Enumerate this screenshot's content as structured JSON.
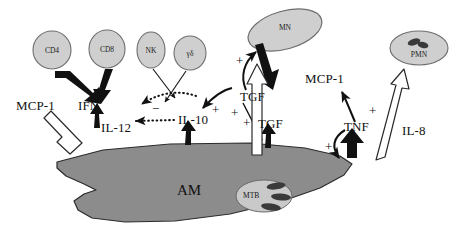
{
  "figure": {
    "background_color": "#ffffff",
    "width": 460,
    "height": 245
  },
  "colors": {
    "cell_fill": "#cfcfcf",
    "cell_stroke": "#6e6e6e",
    "macrophage_fill": "#8c8c8c",
    "macrophage_stroke": "#2b2b2b",
    "mtb_fill": "#c9c9c9",
    "bacillus_fill": "#3a3a3a",
    "arrow_black": "#111111",
    "arrow_hollow_fill": "#ffffff",
    "arrow_hollow_stroke": "#2b2b2b",
    "text": "#111111"
  },
  "cells": [
    {
      "id": "cd4",
      "label": "CD4",
      "cx": 52,
      "cy": 50,
      "rx": 19,
      "ry": 19,
      "rotate": 0
    },
    {
      "id": "cd8",
      "label": "CD8",
      "cx": 107,
      "cy": 49,
      "rx": 18,
      "ry": 19,
      "rotate": 0
    },
    {
      "id": "nk",
      "label": "NK",
      "cx": 151,
      "cy": 50,
      "rx": 14,
      "ry": 18,
      "rotate": 0
    },
    {
      "id": "gd",
      "label": "γδ",
      "cx": 190,
      "cy": 53,
      "rx": 16,
      "ry": 17,
      "rotate": 0
    },
    {
      "id": "mn",
      "label": "MN",
      "cx": 285,
      "cy": 30,
      "rx": 38,
      "ry": 19,
      "rotate": -16
    },
    {
      "id": "pmn",
      "label": "PMN",
      "cx": 419,
      "cy": 48,
      "rx": 29,
      "ry": 17,
      "rotate": 0
    }
  ],
  "macrophage": {
    "label": "AM",
    "label_x": 177,
    "label_y": 191,
    "inclusion": {
      "label": "MTB",
      "cx": 264,
      "cy": 196,
      "rx": 28,
      "ry": 16,
      "bacilli_count": 3
    }
  },
  "mediators": [
    {
      "id": "mcp1-left",
      "label": "MCP-1",
      "x": 16,
      "y": 99
    },
    {
      "id": "ifn",
      "label": "IFN",
      "x": 78,
      "y": 99
    },
    {
      "id": "il12",
      "label": "IL-12",
      "x": 101,
      "y": 121
    },
    {
      "id": "il10",
      "label": "IL-10",
      "x": 178,
      "y": 115
    },
    {
      "id": "tgf-upper",
      "label": "TGF",
      "x": 240,
      "y": 98
    },
    {
      "id": "tgf-lower",
      "label": "TGF",
      "x": 258,
      "y": 124
    },
    {
      "id": "mcp1-right",
      "label": "MCP-1",
      "x": 305,
      "y": 78
    },
    {
      "id": "tnf",
      "label": "TNF",
      "x": 344,
      "y": 127
    },
    {
      "id": "il8",
      "label": "IL-8",
      "x": 402,
      "y": 131
    }
  ],
  "signs": [
    {
      "id": "sign-plus-mn",
      "label": "+",
      "x": 236,
      "y": 60
    },
    {
      "id": "sign-minus-ifn",
      "label": "−",
      "x": 152,
      "y": 108
    },
    {
      "id": "sign-plus-il10",
      "label": "+",
      "x": 215,
      "y": 109
    },
    {
      "id": "sign-plus-tgf-up",
      "label": "+",
      "x": 234,
      "y": 112
    },
    {
      "id": "sign-plus-tgf-low",
      "label": "+",
      "x": 244,
      "y": 122
    },
    {
      "id": "sign-plus-tnf-up",
      "label": "+",
      "x": 369,
      "y": 110
    },
    {
      "id": "sign-plus-tnf-low",
      "label": "+",
      "x": 325,
      "y": 146
    }
  ],
  "arrows": {
    "solid_thick": [
      {
        "id": "cd4-to-ifn",
        "from": "CD4",
        "to": "IFN"
      },
      {
        "id": "cd8-to-ifn",
        "from": "CD8",
        "to": "IFN"
      },
      {
        "id": "il12-to-ifn",
        "from": "IL-12",
        "to": "IFN"
      },
      {
        "id": "am-to-il10",
        "from": "AM",
        "to": "IL-10"
      },
      {
        "id": "am-to-tgf",
        "from": "AM",
        "to": "TGF"
      },
      {
        "id": "am-to-tnf",
        "from": "AM",
        "to": "TNF"
      },
      {
        "id": "mn-to-tgf",
        "from": "MN",
        "to": "TGF"
      }
    ],
    "solid_thin": [
      {
        "id": "nk-to-am",
        "from": "NK",
        "to": "AM"
      },
      {
        "id": "gd-to-am",
        "from": "γδ",
        "to": "AM"
      },
      {
        "id": "tgf-to-mn",
        "from": "TGF",
        "to": "MN",
        "sign": "+"
      },
      {
        "id": "tgf-to-am",
        "from": "TGF",
        "to": "AM",
        "sign": "+"
      },
      {
        "id": "il10-curve",
        "from": "AM",
        "to": "IL-10",
        "sign": "+"
      },
      {
        "id": "tnf-to-mcp1",
        "from": "TNF",
        "to": "MCP-1",
        "sign": "+"
      },
      {
        "id": "tnf-curve",
        "from": "AM",
        "to": "TNF",
        "sign": "+"
      }
    ],
    "dotted_inhibitory": [
      {
        "id": "il10-inhibits-ifn",
        "from": "IL-10",
        "to": "IFN",
        "sign": "−"
      },
      {
        "id": "il10-inhibits-il12",
        "from": "IL-10",
        "to": "IL-12",
        "sign": "−"
      }
    ],
    "hollow_outline": [
      {
        "id": "mcp1-left-hollow",
        "from": "AM",
        "to": "MCP-1"
      },
      {
        "id": "mcp1-right-hollow",
        "from": "AM",
        "to": "MCP-1"
      },
      {
        "id": "il8-hollow",
        "from": "AM",
        "to": "PMN"
      }
    ]
  }
}
